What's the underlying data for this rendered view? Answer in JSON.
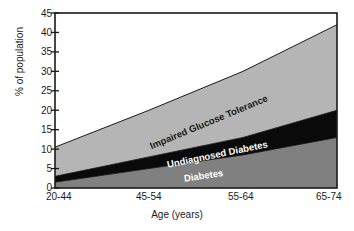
{
  "chart_data": {
    "type": "area",
    "stacked": true,
    "title": "",
    "xlabel": "Age (years)",
    "ylabel": "% of population",
    "categories": [
      "20-44",
      "45-54",
      "55-64",
      "65-74"
    ],
    "x_positions_fraction": [
      0.0,
      0.3333,
      0.6667,
      1.0
    ],
    "ylim": [
      0,
      45
    ],
    "yticks": [
      0,
      5,
      10,
      15,
      20,
      25,
      30,
      35,
      40,
      45
    ],
    "grid": false,
    "legend": "inline-band-labels",
    "series": [
      {
        "name": "Diabetes",
        "color": "#808080",
        "label_color": "#ffffff",
        "values": [
          1.5,
          5.0,
          8.5,
          13.0
        ]
      },
      {
        "name": "Undiagnosed Diabetes",
        "color": "#0a0a0a",
        "label_color": "#ffffff",
        "values": [
          1.5,
          3.0,
          4.5,
          7.0
        ]
      },
      {
        "name": "Impaired Glucose Tolerance",
        "color": "#b5b5b5",
        "label_color": "#1a1a1a",
        "values": [
          7.5,
          12.0,
          17.0,
          22.0
        ]
      }
    ],
    "cumulative_tops": {
      "Diabetes": [
        1.5,
        5.0,
        8.5,
        13.0
      ],
      "Undiagnosed Diabetes": [
        3.0,
        8.0,
        13.0,
        20.0
      ],
      "Impaired Glucose Tolerance": [
        10.5,
        20.0,
        30.0,
        42.0
      ]
    },
    "annotations": [
      {
        "text": "Impaired Glucose Tolerance",
        "series": "Impaired Glucose Tolerance"
      },
      {
        "text": "Undiagnosed Diabetes",
        "series": "Undiagnosed Diabetes"
      },
      {
        "text": "Diabetes",
        "series": "Diabetes"
      }
    ]
  },
  "axis": {
    "y_tick_labels": [
      "45",
      "40",
      "35",
      "30",
      "25",
      "20",
      "15",
      "10",
      "5",
      "0"
    ],
    "y_title": "% of population",
    "x_tick_labels": [
      "20-44",
      "45-54",
      "55-64",
      "65-74"
    ],
    "x_title": "Age (years)"
  },
  "colors": {
    "diabetes": "#808080",
    "undiagnosed": "#0a0a0a",
    "igt": "#b5b5b5",
    "axis": "#1a1a1a",
    "background": "#ffffff"
  }
}
